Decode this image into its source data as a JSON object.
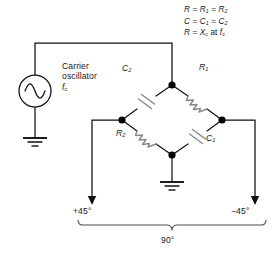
{
  "diagram": {
    "colors": {
      "wire": "#111111",
      "component": "#808080",
      "node": "#000000",
      "text": "#1a1a1a",
      "background": "#ffffff"
    }
  },
  "formulas": {
    "line1_full": "R = R1 = R2",
    "line2_full": "C = C1 = C2",
    "line3_full": "R = Xc at fc",
    "line1": {
      "lhs": "R",
      "eq1": "=",
      "mid": "R",
      "mid_sub": "1",
      "eq2": "=",
      "rhs": "R",
      "rhs_sub": "2"
    },
    "line2": {
      "lhs": "C",
      "eq1": "=",
      "mid": "C",
      "mid_sub": "1",
      "eq2": "=",
      "rhs": "C",
      "rhs_sub": "2"
    },
    "line3": {
      "lhs": "R",
      "eq1": "=",
      "x": "X",
      "x_sub": "c",
      "at": "at",
      "f": "f",
      "f_sub": "c"
    }
  },
  "source": {
    "name": "carrier-oscillator",
    "label_line1": "Carrier",
    "label_line2": "oscillator",
    "label_symbol": "f",
    "label_symbol_sub": "c",
    "symbol": "ac-source-sine-icon"
  },
  "bridge": {
    "arms": [
      {
        "id": "c2",
        "type": "capacitor",
        "label": "C",
        "sub": "2",
        "position": "top-left"
      },
      {
        "id": "r1",
        "type": "resistor",
        "label": "R",
        "sub": "1",
        "position": "top-right"
      },
      {
        "id": "r2",
        "type": "resistor",
        "label": "R",
        "sub": "2",
        "position": "bottom-left"
      },
      {
        "id": "c1",
        "type": "capacitor",
        "label": "C",
        "sub": "1",
        "position": "bottom-right"
      }
    ],
    "nodes": [
      "top",
      "left",
      "right",
      "bottom"
    ]
  },
  "grounds": [
    {
      "id": "source-ground",
      "name": "ground-symbol-source"
    },
    {
      "id": "bridge-ground",
      "name": "ground-symbol-bridge"
    }
  ],
  "outputs": {
    "left": "+45°",
    "right": "−45°",
    "span": "90°"
  }
}
